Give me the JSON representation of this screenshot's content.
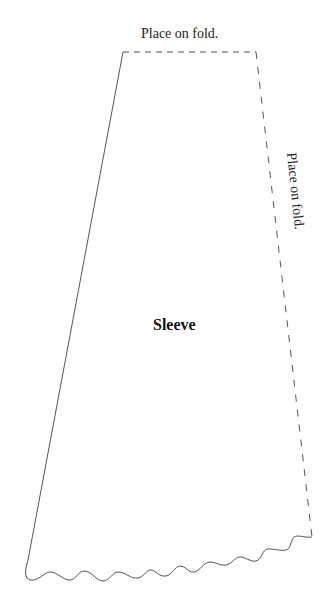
{
  "pattern": {
    "piece_name": "Sleeve",
    "top_edge_label": "Place on fold.",
    "right_edge_label": "Place on fold."
  },
  "colors": {
    "background": "#ffffff",
    "outline": "#555555",
    "text": "#222222"
  },
  "geometry": {
    "top_left": [
      123,
      52
    ],
    "top_right": [
      256,
      52
    ],
    "bottom_right": [
      312,
      537
    ],
    "bottom_left": [
      24,
      576
    ]
  }
}
